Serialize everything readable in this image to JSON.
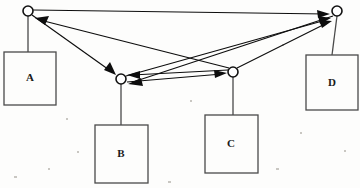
{
  "figure": {
    "type": "directed-graph-diagram",
    "background_color": "#fdfdfc",
    "stroke_color": "#0d0d0d",
    "box_stroke_color": "#4a4a4a",
    "width": 360,
    "height": 188
  },
  "boxes": [
    {
      "id": "A",
      "label": "A",
      "x": 4,
      "y": 52,
      "w": 52,
      "h": 53,
      "cx": 30,
      "cy": 78
    },
    {
      "id": "B",
      "label": "B",
      "x": 95,
      "y": 125,
      "w": 53,
      "h": 58,
      "cx": 121,
      "cy": 154
    },
    {
      "id": "C",
      "label": "C",
      "x": 205,
      "y": 115,
      "w": 53,
      "h": 58,
      "cx": 231,
      "cy": 144
    },
    {
      "id": "D",
      "label": "D",
      "x": 306,
      "y": 55,
      "w": 52,
      "h": 55,
      "cx": 332,
      "cy": 83
    }
  ],
  "nodes": [
    {
      "id": "n1",
      "name": "top-left-node",
      "cx": 28,
      "cy": 11,
      "r": 5,
      "attached_box": "A"
    },
    {
      "id": "n2",
      "name": "middle-left-node",
      "cx": 121,
      "cy": 79,
      "r": 5,
      "attached_box": "B"
    },
    {
      "id": "n3",
      "name": "middle-right-node",
      "cx": 233,
      "cy": 72,
      "r": 5,
      "attached_box": "C"
    },
    {
      "id": "n4",
      "name": "top-right-node",
      "cx": 337,
      "cy": 11,
      "r": 5,
      "attached_box": "D"
    }
  ],
  "stems": [
    {
      "from_node": "n1",
      "to_box": "A",
      "x1": 28,
      "y1": 16,
      "x2": 28,
      "y2": 52
    },
    {
      "from_node": "n2",
      "to_box": "B",
      "x1": 121,
      "y1": 84,
      "x2": 121,
      "y2": 125
    },
    {
      "from_node": "n3",
      "to_box": "C",
      "x1": 233,
      "y1": 77,
      "x2": 233,
      "y2": 115
    },
    {
      "from_node": "n4",
      "to_box": "D",
      "x1": 337,
      "y1": 16,
      "x2": 332,
      "y2": 55
    }
  ],
  "edges": [
    {
      "id": "e1",
      "name": "edge-top-left-to-top-right",
      "from": "n1",
      "to": "n4",
      "directed": true
    },
    {
      "id": "e2",
      "name": "edge-top-left-to-middle-left",
      "from": "n1",
      "to": "n2",
      "directed": true
    },
    {
      "id": "e3",
      "name": "edge-middle-right-to-top-left",
      "from": "n3",
      "to": "n1",
      "directed": true
    },
    {
      "id": "e4",
      "name": "edge-middle-right-to-middle-left",
      "from": "n3",
      "to": "n2",
      "directed": true
    },
    {
      "id": "e5",
      "name": "edge-middle-left-to-middle-right",
      "from": "n2",
      "to": "n3",
      "directed": true
    },
    {
      "id": "e6",
      "name": "edge-top-right-to-middle-left",
      "from": "n4",
      "to": "n2",
      "directed": true
    },
    {
      "id": "e7",
      "name": "edge-middle-left-to-top-right",
      "from": "n2",
      "to": "n4",
      "directed": true
    },
    {
      "id": "e8",
      "name": "edge-middle-right-to-top-right",
      "from": "n3",
      "to": "n4",
      "directed": true
    }
  ]
}
